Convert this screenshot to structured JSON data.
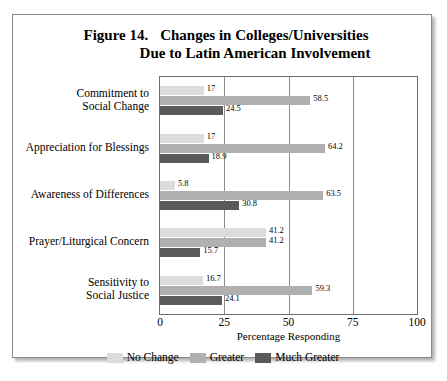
{
  "figure": {
    "number": "Figure 14.",
    "title_line1": "Changes in Colleges/Universities",
    "title_line2": "Due to Latin American Involvement"
  },
  "chart_data": {
    "type": "bar",
    "orientation": "horizontal",
    "xlabel": "Percentage Responding",
    "ylabel": "",
    "xlim": [
      0,
      100
    ],
    "xticks": [
      "0",
      "25",
      "50",
      "75",
      "100"
    ],
    "grid": true,
    "legend_position": "bottom",
    "categories": [
      "Commitment to Social Change",
      "Appreciation for Blessings",
      "Awareness of Differences",
      "Prayer/Liturgical Concern",
      "Sensitivity to Social Justice"
    ],
    "category_lines": [
      [
        "Commitment to",
        "Social Change"
      ],
      [
        "Appreciation for Blessings"
      ],
      [
        "Awareness of Differences"
      ],
      [
        "Prayer/Liturgical Concern"
      ],
      [
        "Sensitivity to",
        "Social Justice"
      ]
    ],
    "series": [
      {
        "name": "No Change",
        "color": "#dcdcdc",
        "values": [
          17,
          17,
          5.8,
          41.2,
          16.7
        ],
        "labels": [
          "17",
          "17",
          "5.8",
          "41.2",
          "16.7"
        ]
      },
      {
        "name": "Greater",
        "color": "#b0b0b0",
        "values": [
          58.5,
          64.2,
          63.5,
          41.2,
          59.3
        ],
        "labels": [
          "58.5",
          "64.2",
          "63.5",
          "41.2",
          "59.3"
        ]
      },
      {
        "name": "Much Greater",
        "color": "#5a5a5a",
        "values": [
          24.5,
          18.9,
          30.8,
          15.7,
          24.1
        ],
        "labels": [
          "24.5",
          "18.9",
          "30.8",
          "15.7",
          "24.1"
        ]
      }
    ]
  }
}
